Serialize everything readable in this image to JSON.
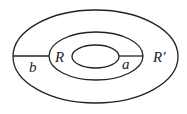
{
  "diagram": {
    "type": "concentric-ellipses",
    "ellipses": [
      {
        "name": "outer",
        "cx": 95.5,
        "cy": 56.5,
        "rx": 82.5,
        "ry": 46.5
      },
      {
        "name": "middle",
        "cx": 96,
        "cy": 56,
        "rx": 47,
        "ry": 24
      },
      {
        "name": "inner",
        "cx": 95.5,
        "cy": 56.5,
        "rx": 23.5,
        "ry": 11.5
      }
    ],
    "labels": {
      "b": "b",
      "R": "R",
      "a": "a",
      "R_prime": "R'"
    },
    "colors": {
      "stroke": "#222222",
      "background": "#ffffff"
    }
  }
}
